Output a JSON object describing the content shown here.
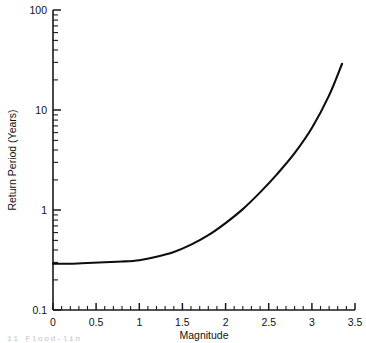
{
  "chart_data": {
    "type": "line",
    "title": "",
    "xlabel": "Magnitude",
    "ylabel": "Return Period (Years)",
    "xlim": [
      0,
      3.5
    ],
    "ylim": [
      0.1,
      100
    ],
    "yscale": "log",
    "xscale": "linear",
    "grid": false,
    "legend": null,
    "x_ticks": [
      "0",
      "0.5",
      "1",
      "1.5",
      "2",
      "2.5",
      "3",
      "3.5"
    ],
    "x_tick_values": [
      0,
      0.5,
      1,
      1.5,
      2,
      2.5,
      3,
      3.5
    ],
    "x_minor_tick_step": 0.1,
    "y_ticks": [
      "0.1",
      "1",
      "10",
      "100"
    ],
    "y_tick_values": [
      0.1,
      1,
      10,
      100
    ],
    "y_minor_ticks_per_decade": 9,
    "series": [
      {
        "name": "Return period curve",
        "color": "#0d0d0d",
        "x": [
          0.0,
          0.2,
          0.4,
          0.6,
          0.8,
          1.0,
          1.2,
          1.4,
          1.6,
          1.8,
          2.0,
          2.2,
          2.4,
          2.6,
          2.8,
          3.0,
          3.2,
          3.35
        ],
        "y": [
          0.29,
          0.29,
          0.295,
          0.3,
          0.305,
          0.315,
          0.34,
          0.38,
          0.45,
          0.56,
          0.74,
          1.02,
          1.5,
          2.3,
          3.7,
          6.6,
          14.0,
          29.0
        ]
      }
    ]
  },
  "caption": {
    "fragment": "11   Flood-lin"
  }
}
